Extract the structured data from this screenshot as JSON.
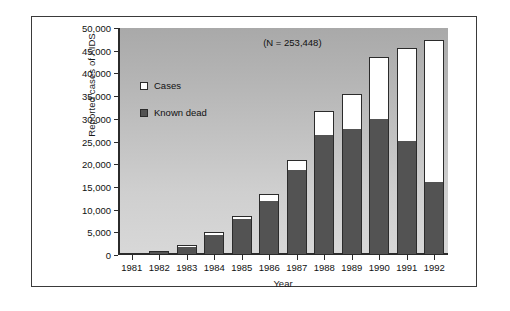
{
  "chart_data": {
    "type": "bar",
    "subtype": "stacked",
    "title": "",
    "annotation": "(N = 253,448)",
    "xlabel": "Year",
    "ylabel": "Reported cases of AIDS",
    "categories": [
      "1981",
      "1982",
      "1983",
      "1984",
      "1985",
      "1986",
      "1987",
      "1988",
      "1989",
      "1990",
      "1991",
      "1992"
    ],
    "ylim": [
      0,
      50000
    ],
    "ytick_values": [
      0,
      5000,
      10000,
      15000,
      20000,
      25000,
      30000,
      35000,
      40000,
      45000,
      50000
    ],
    "ytick_labels": [
      "0",
      "5,000",
      "10,000",
      "15,000",
      "20,000",
      "25,000",
      "30,000",
      "35,000",
      "40,000",
      "45,000",
      "50,000"
    ],
    "grid": false,
    "legend_position": "inside-upper-left",
    "series": [
      {
        "name": "Known dead",
        "color": "#535353",
        "values": [
          300,
          700,
          2000,
          4600,
          8200,
          12100,
          19000,
          26500,
          27800,
          30000,
          25200,
          16000
        ]
      },
      {
        "name": "Cases",
        "color": "#ffffff",
        "note": "white segment = total reported cases minus known dead",
        "values": [
          100,
          200,
          300,
          400,
          500,
          1300,
          1900,
          5300,
          7700,
          13700,
          20500,
          31400
        ]
      }
    ],
    "totals": [
      400,
      900,
      2300,
      5000,
      8700,
      13400,
      20900,
      31800,
      35500,
      43700,
      45700,
      47400
    ]
  },
  "legend": {
    "items": [
      {
        "label": "Cases",
        "swatch": "white-square"
      },
      {
        "label": "Known dead",
        "swatch": "dark-gray-square"
      }
    ]
  }
}
